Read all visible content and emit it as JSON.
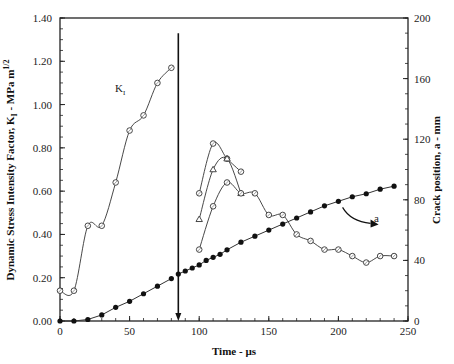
{
  "chart_data": {
    "type": "line",
    "title": "",
    "xlabel": "Time - µs",
    "ylabel": "Dynamic Stress Intensity Factor, K_I - MPa m^1/2",
    "ylabel_right": "Crack position, a - mm",
    "xlim": [
      0,
      250
    ],
    "ylim": [
      0,
      1.4
    ],
    "ylim_right": [
      0,
      200
    ],
    "x_ticks": [
      "0",
      "50",
      "100",
      "150",
      "200",
      "250"
    ],
    "y_ticks": [
      "0.00",
      "0.20",
      "0.40",
      "0.60",
      "0.80",
      "1.00",
      "1.20",
      "1.40"
    ],
    "y_ticks_right": [
      "0",
      "40",
      "80",
      "120",
      "160",
      "200"
    ],
    "grid": false,
    "annotations": [
      {
        "text": "K_I",
        "x": 68,
        "y": 1.07
      },
      {
        "text": "a",
        "x": 238,
        "y": 72,
        "axis": "right"
      },
      {
        "type": "vertical-arrow",
        "x": 85,
        "from": 1.33,
        "to": 0.0
      }
    ],
    "series": [
      {
        "name": "K_I (before arrest)",
        "axis": "left",
        "marker": "open-circle",
        "x": [
          0,
          10,
          20,
          30,
          40,
          50,
          60,
          70,
          80
        ],
        "values": [
          0.14,
          0.14,
          0.44,
          0.44,
          0.64,
          0.88,
          0.95,
          1.1,
          1.17
        ]
      },
      {
        "name": "K_I upper (open circle)",
        "axis": "left",
        "marker": "open-circle",
        "x": [
          100,
          110,
          120,
          130
        ],
        "values": [
          0.59,
          0.82,
          0.75,
          0.69
        ]
      },
      {
        "name": "K_I (triangle)",
        "axis": "left",
        "marker": "open-triangle",
        "x": [
          100,
          110,
          120,
          130
        ],
        "values": [
          0.47,
          0.7,
          0.75,
          0.59
        ]
      },
      {
        "name": "K_I lower (open circle)",
        "axis": "left",
        "marker": "open-circle",
        "x": [
          100,
          110,
          120,
          130,
          140,
          150,
          160,
          170,
          180,
          190,
          200,
          210,
          220,
          230,
          240
        ],
        "values": [
          0.33,
          0.53,
          0.64,
          0.59,
          0.59,
          0.49,
          0.49,
          0.4,
          0.37,
          0.33,
          0.33,
          0.3,
          0.27,
          0.3,
          0.3
        ]
      },
      {
        "name": "Crack position a (before arrest)",
        "axis": "right",
        "marker": "filled-circle",
        "x": [
          0,
          10,
          20,
          30,
          40,
          50,
          60,
          70,
          80
        ],
        "values": [
          0,
          0,
          1,
          4,
          9,
          13,
          18,
          23,
          28
        ]
      },
      {
        "name": "Crack position a (after)",
        "axis": "right",
        "marker": "filled-circle",
        "x": [
          85,
          90,
          95,
          100,
          105,
          110,
          115,
          120,
          130,
          140,
          150,
          160,
          170,
          180,
          190,
          200,
          210,
          220,
          230,
          240
        ],
        "values": [
          31,
          33,
          35,
          37,
          40,
          42,
          44,
          47,
          52,
          56,
          60,
          64,
          68,
          72,
          76,
          79,
          82,
          84,
          87,
          89
        ]
      }
    ]
  },
  "labels": {
    "x_axis": "Time - µs",
    "y_axis_left_pre": "Dynamic Stress Intensity Factor, K",
    "y_axis_left_sub": "I",
    "y_axis_left_post": " - MPa m",
    "y_axis_left_sup": "1/2",
    "y_axis_right": "Crack position, a - mm",
    "k_annot": "K",
    "k_annot_sub": "I",
    "a_annot": "a"
  }
}
